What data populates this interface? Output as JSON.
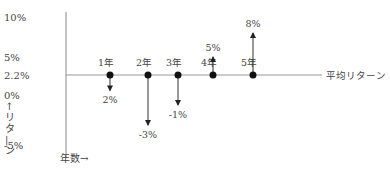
{
  "chart_data": {
    "type": "line",
    "title": "",
    "xlabel": "年数→",
    "ylabel": "↑リターン",
    "baseline": {
      "label": "平均リターン",
      "value": 2.2
    },
    "y_ticks": [
      {
        "label": "10%",
        "value": 10
      },
      {
        "label": "5%",
        "value": 5
      },
      {
        "label": "2.2%",
        "value": 2.2
      },
      {
        "label": "0%",
        "value": 0
      },
      {
        "label": "-5%",
        "value": -5
      }
    ],
    "ylim": [
      -5,
      10
    ],
    "categories": [
      "1年",
      "2年",
      "3年",
      "4年",
      "5年"
    ],
    "points": [
      {
        "category": "1年",
        "value": 2.2,
        "arrow_to": 0.5,
        "label": "2%"
      },
      {
        "category": "2年",
        "value": 2.2,
        "arrow_to": -3,
        "label": "-3%"
      },
      {
        "category": "3年",
        "value": 2.2,
        "arrow_to": -1,
        "label": "-1%"
      },
      {
        "category": "4年",
        "value": 2.2,
        "arrow_to": 5,
        "label": "5%"
      },
      {
        "category": "5年",
        "value": 2.2,
        "arrow_to": 8,
        "label": "8%"
      }
    ],
    "grid": false,
    "legend": "none"
  }
}
